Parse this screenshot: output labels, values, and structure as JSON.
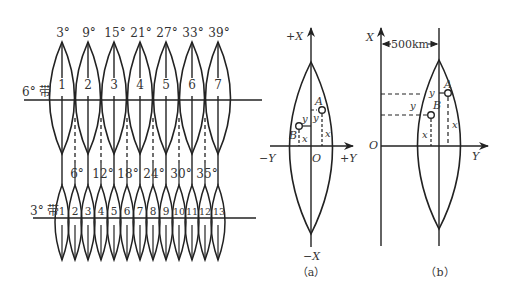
{
  "zones_diagram": {
    "six_degree_band": {
      "label": "6° 带",
      "central_meridians": [
        "3°",
        "9°",
        "15°",
        "21°",
        "27°",
        "33°",
        "39°"
      ],
      "zone_numbers": [
        "1",
        "2",
        "3",
        "4",
        "5",
        "6",
        "7"
      ]
    },
    "three_degree_band": {
      "label": "3° 带",
      "boundary_meridians": [
        "6°",
        "12°",
        "18°",
        "24°",
        "30°",
        "35°"
      ],
      "zone_numbers": [
        "1",
        "2",
        "3",
        "4",
        "5",
        "6",
        "7",
        "8",
        "9",
        "10",
        "11",
        "12",
        "13"
      ]
    }
  },
  "diagram_a": {
    "caption": "（a）",
    "axis_plus_x": "+X",
    "axis_minus_x": "−X",
    "axis_plus_y": "+Y",
    "axis_minus_y": "−Y",
    "origin": "O",
    "point_a": "A",
    "point_b": "B",
    "coord_x": "x",
    "coord_y": "y"
  },
  "diagram_b": {
    "caption": "（b）",
    "axis_x": "X",
    "axis_y": "Y",
    "origin": "O",
    "offset_label": "500km",
    "point_a": "A",
    "point_b": "B",
    "coord_x": "x",
    "coord_y": "y"
  },
  "colors": {
    "line": "#222222",
    "text": "#333333",
    "background": "#ffffff"
  }
}
